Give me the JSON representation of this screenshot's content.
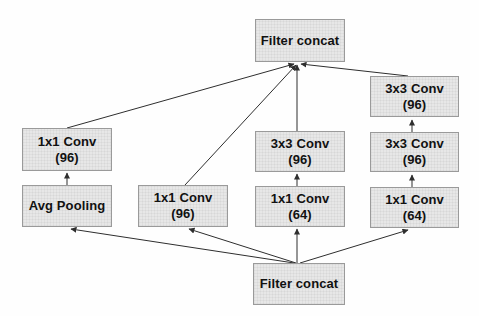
{
  "diagram": {
    "nodes": {
      "concat_top": {
        "label": "Filter concat"
      },
      "b4_conv3": {
        "label": "3x3 Conv",
        "detail": "(96)"
      },
      "b1_conv": {
        "label": "1x1 Conv",
        "detail": "(96)"
      },
      "b3_conv2": {
        "label": "3x3 Conv",
        "detail": "(96)"
      },
      "b4_conv2": {
        "label": "3x3 Conv",
        "detail": "(96)"
      },
      "b1_pool": {
        "label": "Avg Pooling"
      },
      "b2_conv": {
        "label": "1x1 Conv",
        "detail": "(96)"
      },
      "b3_conv1": {
        "label": "1x1 Conv",
        "detail": "(64)"
      },
      "b4_conv1": {
        "label": "1x1 Conv",
        "detail": "(64)"
      },
      "concat_bottom": {
        "label": "Filter concat"
      }
    },
    "colors": {
      "node_fill": "#e7e7e7",
      "node_border": "#9a9a9a",
      "edge": "#2e2e2e",
      "text": "#111111",
      "background": "#fefefe"
    }
  }
}
